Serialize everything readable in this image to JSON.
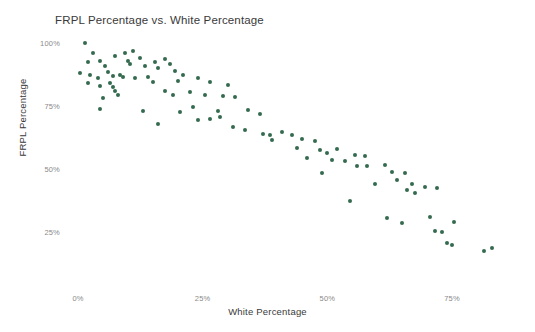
{
  "chart_data": {
    "type": "scatter",
    "title": "FRPL Percentage vs. White Percentage",
    "xlabel": "White Percentage",
    "ylabel": "FRPL Percentage",
    "xlim": [
      -3,
      85
    ],
    "ylim": [
      8,
      104
    ],
    "grid": false,
    "legend": null,
    "marker_color": "#346b4e",
    "marker_size_px": 4,
    "xticks": [
      {
        "value": 0,
        "label": "0%"
      },
      {
        "value": 25,
        "label": "25%"
      },
      {
        "value": 50,
        "label": "50%"
      },
      {
        "value": 75,
        "label": "75%"
      }
    ],
    "yticks": [
      {
        "value": 100,
        "label": "100%"
      },
      {
        "value": 75,
        "label": "75%"
      },
      {
        "value": 50,
        "label": "50%"
      },
      {
        "value": 25,
        "label": "25%"
      }
    ],
    "series": [
      {
        "name": "Schools",
        "points": [
          [
            1.5,
            100.0
          ],
          [
            3.0,
            96.0
          ],
          [
            2.0,
            92.5
          ],
          [
            4.5,
            93.0
          ],
          [
            5.5,
            91.0
          ],
          [
            7.5,
            95.0
          ],
          [
            9.5,
            96.0
          ],
          [
            11.0,
            97.0
          ],
          [
            12.5,
            94.0
          ],
          [
            10.0,
            93.0
          ],
          [
            10.5,
            91.5
          ],
          [
            13.5,
            91.0
          ],
          [
            15.5,
            92.5
          ],
          [
            16.0,
            90.0
          ],
          [
            17.5,
            93.5
          ],
          [
            18.5,
            91.5
          ],
          [
            19.5,
            89.0
          ],
          [
            0.5,
            88.0
          ],
          [
            2.5,
            87.5
          ],
          [
            4.0,
            86.0
          ],
          [
            6.0,
            88.5
          ],
          [
            7.0,
            87.0
          ],
          [
            8.5,
            87.5
          ],
          [
            9.0,
            86.5
          ],
          [
            11.5,
            86.0
          ],
          [
            6.5,
            84.0
          ],
          [
            7.0,
            82.5
          ],
          [
            7.5,
            81.0
          ],
          [
            8.0,
            79.5
          ],
          [
            4.5,
            83.0
          ],
          [
            2.0,
            84.0
          ],
          [
            5.0,
            78.0
          ],
          [
            14.0,
            86.5
          ],
          [
            15.0,
            84.5
          ],
          [
            21.0,
            87.5
          ],
          [
            20.0,
            85.0
          ],
          [
            24.0,
            86.0
          ],
          [
            26.5,
            84.5
          ],
          [
            30.0,
            83.5
          ],
          [
            4.5,
            74.0
          ],
          [
            17.5,
            81.0
          ],
          [
            19.0,
            79.5
          ],
          [
            22.5,
            80.5
          ],
          [
            25.5,
            79.5
          ],
          [
            29.0,
            79.0
          ],
          [
            31.5,
            78.5
          ],
          [
            13.0,
            73.0
          ],
          [
            20.5,
            72.5
          ],
          [
            23.0,
            74.5
          ],
          [
            28.0,
            73.0
          ],
          [
            16.0,
            68.0
          ],
          [
            24.0,
            69.5
          ],
          [
            26.5,
            70.0
          ],
          [
            28.5,
            70.5
          ],
          [
            34.0,
            73.5
          ],
          [
            36.5,
            72.0
          ],
          [
            31.0,
            66.5
          ],
          [
            33.5,
            65.5
          ],
          [
            37.0,
            64.0
          ],
          [
            38.5,
            63.5
          ],
          [
            41.0,
            64.5
          ],
          [
            43.0,
            63.5
          ],
          [
            39.0,
            61.5
          ],
          [
            45.0,
            62.0
          ],
          [
            47.5,
            61.0
          ],
          [
            44.0,
            58.5
          ],
          [
            48.5,
            57.5
          ],
          [
            50.0,
            56.5
          ],
          [
            52.0,
            58.0
          ],
          [
            46.0,
            54.5
          ],
          [
            51.0,
            53.5
          ],
          [
            53.5,
            53.0
          ],
          [
            55.5,
            55.5
          ],
          [
            57.5,
            55.0
          ],
          [
            56.0,
            51.0
          ],
          [
            58.0,
            51.0
          ],
          [
            61.5,
            51.5
          ],
          [
            49.0,
            48.5
          ],
          [
            63.0,
            49.0
          ],
          [
            65.5,
            48.5
          ],
          [
            64.0,
            45.5
          ],
          [
            59.5,
            44.0
          ],
          [
            67.0,
            44.0
          ],
          [
            66.0,
            41.5
          ],
          [
            67.5,
            40.5
          ],
          [
            54.5,
            37.5
          ],
          [
            69.5,
            43.0
          ],
          [
            72.0,
            42.5
          ],
          [
            62.0,
            30.5
          ],
          [
            65.0,
            28.5
          ],
          [
            70.5,
            31.0
          ],
          [
            71.5,
            25.5
          ],
          [
            73.0,
            25.0
          ],
          [
            75.5,
            29.0
          ],
          [
            74.0,
            20.5
          ],
          [
            75.0,
            20.0
          ],
          [
            81.5,
            17.5
          ],
          [
            83.0,
            18.5
          ]
        ]
      }
    ]
  }
}
